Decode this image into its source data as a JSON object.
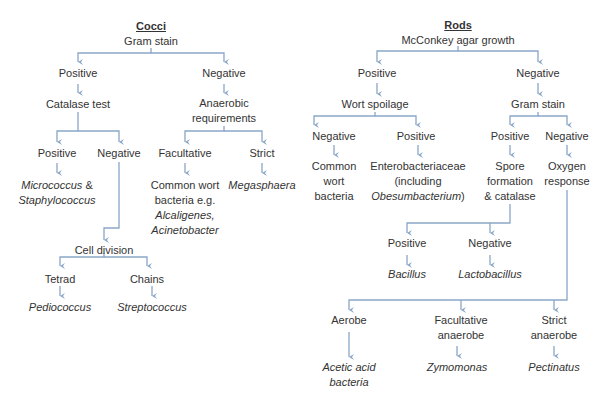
{
  "colors": {
    "line": "#8aa6c8",
    "text": "#333333"
  },
  "cocci": {
    "title": "Cocci",
    "root": "Gram stain",
    "positive": "Positive",
    "negative": "Negative",
    "catalase_test": "Catalase test",
    "anaerobic_l1": "Anaerobic",
    "anaerobic_l2": "requirements",
    "cat_positive": "Positive",
    "cat_negative": "Negative",
    "facultative": "Facultative",
    "strict": "Strict",
    "micrococcus_l1_it": "Micrococcus",
    "micrococcus_l1_rest": " &",
    "micrococcus_l2": "Staphylococcus",
    "wort_l1": "Common wort",
    "wort_l2": "bacteria e.g.",
    "wort_l3": "Alcaligenes,",
    "wort_l4": "Acinetobacter",
    "megasphaera": "Megasphaera",
    "cell_division": "Cell division",
    "tetrad": "Tetrad",
    "chains": "Chains",
    "pediococcus": "Pediococcus",
    "streptococcus": "Streptococcus"
  },
  "rods": {
    "title": "Rods",
    "root": "McConkey agar growth",
    "positive": "Positive",
    "negative": "Negative",
    "wort_spoilage": "Wort spoilage",
    "gram_stain": "Gram stain",
    "ws_negative": "Negative",
    "ws_positive": "Positive",
    "gs_positive": "Positive",
    "gs_negative": "Negative",
    "common_l1": "Common",
    "common_l2": "wort",
    "common_l3": "bacteria",
    "entero_l1": "Enterobacteriaceae",
    "entero_l2": "(including",
    "entero_l3_it": "Obesumbacterium",
    "entero_l3_rest": ")",
    "spore_l1": "Spore",
    "spore_l2": "formation",
    "spore_l3": "& catalase",
    "oxygen_l1": "Oxygen",
    "oxygen_l2": "response",
    "sc_positive": "Positive",
    "sc_negative": "Negative",
    "bacillus": "Bacillus",
    "lactobacillus": "Lactobacillus",
    "aerobe": "Aerobe",
    "facultative_l1": "Facultative",
    "facultative_l2": "anaerobe",
    "strict_l1": "Strict",
    "strict_l2": "anaerobe",
    "acetic_l1": "Acetic acid",
    "acetic_l2": "bacteria",
    "zymomonas": "Zymomonas",
    "pectinatus": "Pectinatus"
  }
}
